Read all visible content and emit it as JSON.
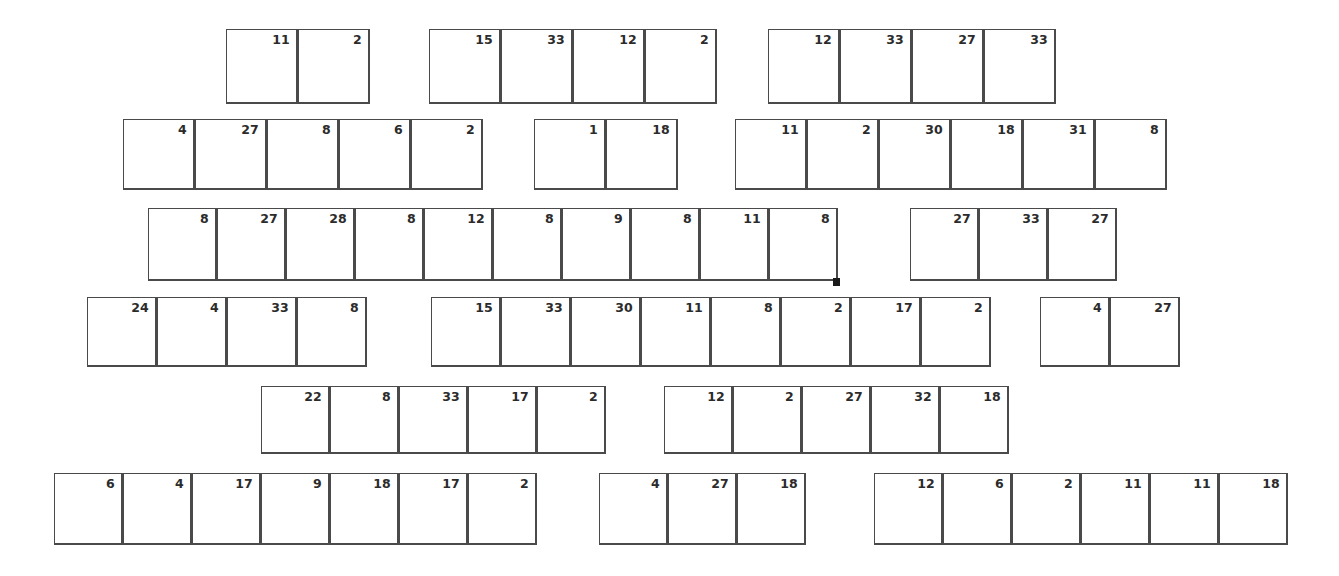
{
  "page": {
    "background_color": "#ffffff",
    "cell_border_color": "#4a4a4a",
    "text_color": "#2b2b2b",
    "marker_color": "#1a1a1a",
    "width": 1339,
    "height": 576
  },
  "marker": {
    "name": "black-square-marker",
    "x": 833,
    "y": 278,
    "width": 7,
    "height": 8
  },
  "rows": [
    {
      "id": "row-1",
      "top": 29,
      "cell_width": 72,
      "cell_height": 75,
      "groups": [
        {
          "id": "row-1-group-1",
          "left": 226,
          "values": [
            11,
            2
          ]
        },
        {
          "id": "row-1-group-2",
          "left": 429,
          "values": [
            15,
            33,
            12,
            2
          ]
        },
        {
          "id": "row-1-group-3",
          "left": 768,
          "values": [
            12,
            33,
            27,
            33
          ]
        }
      ]
    },
    {
      "id": "row-2",
      "top": 119,
      "cell_width": 72,
      "cell_height": 71,
      "groups": [
        {
          "id": "row-2-group-1",
          "left": 123,
          "values": [
            4,
            27,
            8,
            6,
            2
          ]
        },
        {
          "id": "row-2-group-2",
          "left": 534,
          "values": [
            1,
            18
          ]
        },
        {
          "id": "row-2-group-3",
          "left": 735,
          "values": [
            11,
            2,
            30,
            18,
            31,
            8
          ]
        }
      ]
    },
    {
      "id": "row-3",
      "top": 208,
      "cell_width": 69,
      "cell_height": 73,
      "groups": [
        {
          "id": "row-3-group-1",
          "left": 148,
          "values": [
            8,
            27,
            28,
            8,
            12,
            8,
            9,
            8,
            11,
            8
          ]
        },
        {
          "id": "row-3-group-2",
          "left": 910,
          "values": [
            27,
            33,
            27
          ]
        }
      ]
    },
    {
      "id": "row-4",
      "top": 297,
      "cell_width": 70,
      "cell_height": 70,
      "groups": [
        {
          "id": "row-4-group-1",
          "left": 87,
          "values": [
            24,
            4,
            33,
            8
          ]
        },
        {
          "id": "row-4-group-2",
          "left": 431,
          "values": [
            15,
            33,
            30,
            11,
            8,
            2,
            17,
            2
          ]
        },
        {
          "id": "row-4-group-3",
          "left": 1040,
          "values": [
            4,
            27
          ]
        }
      ]
    },
    {
      "id": "row-5",
      "top": 386,
      "cell_width": 69,
      "cell_height": 68,
      "groups": [
        {
          "id": "row-5-group-1",
          "left": 261,
          "values": [
            22,
            8,
            33,
            17,
            2
          ]
        },
        {
          "id": "row-5-group-2",
          "left": 664,
          "values": [
            12,
            2,
            27,
            32,
            18
          ]
        }
      ]
    },
    {
      "id": "row-6",
      "top": 473,
      "cell_width": 69,
      "cell_height": 72,
      "groups": [
        {
          "id": "row-6-group-1",
          "left": 54,
          "values": [
            6,
            4,
            17,
            9,
            18,
            17,
            2
          ]
        },
        {
          "id": "row-6-group-2",
          "left": 599,
          "values": [
            4,
            27,
            18
          ]
        },
        {
          "id": "row-6-group-3",
          "left": 874,
          "values": [
            12,
            6,
            2,
            11,
            11,
            18
          ]
        }
      ]
    }
  ]
}
